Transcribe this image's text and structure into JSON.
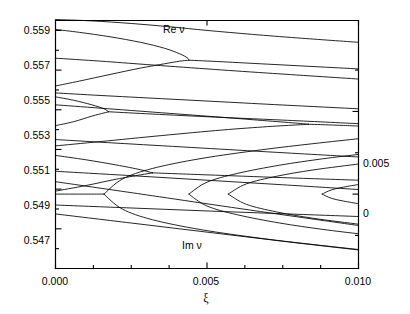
{
  "figure": {
    "background": "#ffffff",
    "line_color": "#000000",
    "axis_color": "#000000"
  },
  "axes": {
    "left": {
      "title": "",
      "ticks": [
        "0.559",
        "0.557",
        "0.555",
        "0.553",
        "0.551",
        "0.549",
        "0.547"
      ],
      "range": [
        0.547,
        0.5595
      ]
    },
    "right": {
      "title": "",
      "ticks": [
        "0.005",
        "0"
      ],
      "range": [
        -0.0045,
        0.0105
      ]
    },
    "bottom": {
      "title": "ξ",
      "ticks": [
        "0.000",
        "0.005",
        "0.010"
      ],
      "range": [
        0.0,
        0.01
      ]
    }
  },
  "annotations": [
    {
      "text": "Re ν",
      "x": 0.0038,
      "y": 0.5593
    },
    {
      "text": "Im ν",
      "x": 0.0044,
      "y": 0.5487
    }
  ],
  "chart_data": {
    "type": "line",
    "title": "",
    "xlabel": "ξ",
    "ylabel_left": "Re ν",
    "ylabel_right": "Im ν",
    "grid": false,
    "legend": "none",
    "xlim": [
      0.0,
      0.01
    ],
    "ylim_left": [
      0.547,
      0.5595
    ],
    "ylim_right": [
      -0.0045,
      0.0105
    ],
    "xticks": [
      0.0,
      0.005,
      0.01
    ],
    "xticklabels": [
      "0.000",
      "0.005",
      "0.010"
    ],
    "yticks_left": [
      0.547,
      0.549,
      0.551,
      0.553,
      0.555,
      0.557,
      0.559
    ],
    "yticklabels_left": [
      "0.547",
      "0.549",
      "0.551",
      "0.553",
      "0.555",
      "0.557",
      "0.559"
    ],
    "yticks_right": [
      0.0,
      0.005
    ],
    "yticklabels_right": [
      "0",
      "0.005"
    ],
    "series": [
      {
        "name": "Re nu branch 1 upper",
        "axis": "left",
        "points": [
          [
            0.0,
            0.55955
          ],
          [
            0.0012,
            0.55948
          ],
          [
            0.0025,
            0.55935
          ],
          [
            0.0038,
            0.55918
          ],
          [
            0.005,
            0.559
          ],
          [
            0.0065,
            0.5588
          ],
          [
            0.008,
            0.55862
          ],
          [
            0.01,
            0.5584
          ]
        ]
      },
      {
        "name": "Re nu pair A upper (turning at xi=0.0044)",
        "axis": "left",
        "points": [
          [
            0.0,
            0.55905
          ],
          [
            0.0008,
            0.5589
          ],
          [
            0.0018,
            0.55868
          ],
          [
            0.0028,
            0.5584
          ],
          [
            0.0036,
            0.5581
          ],
          [
            0.0041,
            0.55782
          ],
          [
            0.00435,
            0.55762
          ],
          [
            0.0044,
            0.5575
          ]
        ]
      },
      {
        "name": "Re nu pair A lower (turning at xi=0.0044)",
        "axis": "left",
        "points": [
          [
            0.0,
            0.5562
          ],
          [
            0.0008,
            0.55645
          ],
          [
            0.0018,
            0.55678
          ],
          [
            0.0028,
            0.5571
          ],
          [
            0.0036,
            0.55732
          ],
          [
            0.0041,
            0.55745
          ],
          [
            0.00435,
            0.55749
          ],
          [
            0.0044,
            0.5575
          ]
        ]
      },
      {
        "name": "Re nu pair A merged tail",
        "axis": "left",
        "points": [
          [
            0.0044,
            0.5575
          ],
          [
            0.0055,
            0.55742
          ],
          [
            0.007,
            0.5573
          ],
          [
            0.0085,
            0.55718
          ],
          [
            0.01,
            0.55706
          ]
        ]
      },
      {
        "name": "Re nu branch 2",
        "axis": "left",
        "points": [
          [
            0.0,
            0.5576
          ],
          [
            0.0015,
            0.55745
          ],
          [
            0.003,
            0.55728
          ],
          [
            0.005,
            0.55706
          ],
          [
            0.007,
            0.55685
          ],
          [
            0.01,
            0.55655
          ]
        ]
      },
      {
        "name": "Re nu branch 3",
        "axis": "left",
        "points": [
          [
            0.0,
            0.55585
          ],
          [
            0.0015,
            0.55572
          ],
          [
            0.0035,
            0.55556
          ],
          [
            0.0055,
            0.5554
          ],
          [
            0.0075,
            0.55524
          ],
          [
            0.01,
            0.55505
          ]
        ]
      },
      {
        "name": "Re nu pair B upper (turning at xi=0.00835)",
        "axis": "left",
        "points": [
          [
            0.0,
            0.55525
          ],
          [
            0.0015,
            0.55508
          ],
          [
            0.0035,
            0.55485
          ],
          [
            0.0055,
            0.55462
          ],
          [
            0.007,
            0.55444
          ],
          [
            0.008,
            0.55432
          ],
          [
            0.00835,
            0.55427
          ]
        ]
      },
      {
        "name": "Re nu pair B lower (turning at xi=0.00835)",
        "axis": "left",
        "points": [
          [
            0.0,
            0.55318
          ],
          [
            0.0015,
            0.5534
          ],
          [
            0.0035,
            0.5537
          ],
          [
            0.0055,
            0.55398
          ],
          [
            0.007,
            0.55415
          ],
          [
            0.008,
            0.55424
          ],
          [
            0.00835,
            0.55427
          ]
        ]
      },
      {
        "name": "Re nu pair B merged tail",
        "axis": "left",
        "points": [
          [
            0.00835,
            0.55427
          ],
          [
            0.009,
            0.55424
          ],
          [
            0.0095,
            0.55421
          ],
          [
            0.01,
            0.55418
          ]
        ]
      },
      {
        "name": "Re nu pair C upper (turning at xi=0.00175)",
        "axis": "left",
        "points": [
          [
            0.0,
            0.55565
          ],
          [
            0.0006,
            0.55548
          ],
          [
            0.0012,
            0.55525
          ],
          [
            0.0016,
            0.55505
          ],
          [
            0.00175,
            0.5549
          ]
        ]
      },
      {
        "name": "Re nu pair C lower (turning at xi=0.00175)",
        "axis": "left",
        "points": [
          [
            0.0,
            0.5542
          ],
          [
            0.0006,
            0.5544
          ],
          [
            0.0012,
            0.55468
          ],
          [
            0.0016,
            0.55484
          ],
          [
            0.00175,
            0.5549
          ]
        ]
      },
      {
        "name": "Re nu pair C merged tail",
        "axis": "left",
        "points": [
          [
            0.00175,
            0.5549
          ],
          [
            0.003,
            0.5548
          ],
          [
            0.005,
            0.55465
          ],
          [
            0.0075,
            0.55448
          ],
          [
            0.01,
            0.5543
          ]
        ]
      },
      {
        "name": "Re nu branch 4",
        "axis": "left",
        "points": [
          [
            0.0,
            0.5535
          ],
          [
            0.002,
            0.55332
          ],
          [
            0.0045,
            0.5531
          ],
          [
            0.007,
            0.55288
          ],
          [
            0.01,
            0.55262
          ]
        ]
      },
      {
        "name": "Re nu pair D upper (turning at xi=0.0032)",
        "axis": "left",
        "points": [
          [
            0.0,
            0.5527
          ],
          [
            0.001,
            0.55248
          ],
          [
            0.002,
            0.55222
          ],
          [
            0.0028,
            0.55198
          ],
          [
            0.0032,
            0.55182
          ]
        ]
      },
      {
        "name": "Re nu pair D lower (turning at xi=0.0032)",
        "axis": "left",
        "points": [
          [
            0.0,
            0.5509
          ],
          [
            0.001,
            0.55118
          ],
          [
            0.002,
            0.5515
          ],
          [
            0.0028,
            0.55172
          ],
          [
            0.0032,
            0.55182
          ]
        ]
      },
      {
        "name": "Re nu pair D merged tail",
        "axis": "left",
        "points": [
          [
            0.0032,
            0.55182
          ],
          [
            0.005,
            0.55172
          ],
          [
            0.0075,
            0.55158
          ],
          [
            0.01,
            0.55145
          ]
        ]
      },
      {
        "name": "Re nu branch 5",
        "axis": "left",
        "points": [
          [
            0.0,
            0.5519
          ],
          [
            0.0025,
            0.55168
          ],
          [
            0.005,
            0.55145
          ],
          [
            0.0075,
            0.55122
          ],
          [
            0.01,
            0.55098
          ]
        ]
      },
      {
        "name": "Re nu branch 6",
        "axis": "left",
        "points": [
          [
            0.0,
            0.5502
          ],
          [
            0.0025,
            0.55005
          ],
          [
            0.005,
            0.5499
          ],
          [
            0.0075,
            0.54976
          ],
          [
            0.01,
            0.54962
          ]
        ]
      },
      {
        "name": "Im nu zero axis segment",
        "axis": "right",
        "points": [
          [
            0.0,
            0.0
          ],
          [
            0.001,
            0.0
          ],
          [
            0.0016,
            0.0
          ]
        ]
      },
      {
        "name": "Im nu loop 1 upper (opens at xi=0.0016)",
        "axis": "right",
        "points": [
          [
            0.0016,
            0.0
          ],
          [
            0.0022,
            0.0009
          ],
          [
            0.0032,
            0.00155
          ],
          [
            0.0048,
            0.00215
          ],
          [
            0.0068,
            0.00268
          ],
          [
            0.0085,
            0.00305
          ],
          [
            0.01,
            0.00335
          ]
        ]
      },
      {
        "name": "Im nu loop 1 lower (opens at xi=0.0016)",
        "axis": "right",
        "points": [
          [
            0.0016,
            0.0
          ],
          [
            0.0022,
            -0.0009
          ],
          [
            0.0032,
            -0.00155
          ],
          [
            0.0048,
            -0.00215
          ],
          [
            0.0068,
            -0.00268
          ],
          [
            0.0085,
            -0.00305
          ],
          [
            0.01,
            -0.00335
          ]
        ]
      },
      {
        "name": "Im nu loop 2 upper (opens at xi=0.0044)",
        "axis": "right",
        "points": [
          [
            0.0044,
            0.0
          ],
          [
            0.005,
            0.00072
          ],
          [
            0.006,
            0.00125
          ],
          [
            0.0074,
            0.00175
          ],
          [
            0.0088,
            0.00213
          ],
          [
            0.01,
            0.0024
          ]
        ]
      },
      {
        "name": "Im nu loop 2 lower (opens at xi=0.0044)",
        "axis": "right",
        "points": [
          [
            0.0044,
            0.0
          ],
          [
            0.005,
            -0.00072
          ],
          [
            0.006,
            -0.00125
          ],
          [
            0.0074,
            -0.00175
          ],
          [
            0.0088,
            -0.00213
          ],
          [
            0.01,
            -0.0024
          ]
        ]
      },
      {
        "name": "Im nu loop 3 upper (opens at xi=0.0057)",
        "axis": "right",
        "points": [
          [
            0.0057,
            0.0
          ],
          [
            0.0063,
            0.00062
          ],
          [
            0.0073,
            0.00108
          ],
          [
            0.0085,
            0.00146
          ],
          [
            0.01,
            0.00182
          ]
        ]
      },
      {
        "name": "Im nu loop 3 lower (opens at xi=0.0057)",
        "axis": "right",
        "points": [
          [
            0.0057,
            0.0
          ],
          [
            0.0063,
            -0.00062
          ],
          [
            0.0073,
            -0.00108
          ],
          [
            0.0085,
            -0.00146
          ],
          [
            0.01,
            -0.00182
          ]
        ]
      },
      {
        "name": "Im nu loop 4 upper (opens at xi=0.0088)",
        "axis": "right",
        "points": [
          [
            0.0088,
            0.0
          ],
          [
            0.0091,
            0.00025
          ],
          [
            0.0095,
            0.00042
          ],
          [
            0.01,
            0.00058
          ]
        ]
      },
      {
        "name": "Im nu loop 4 lower (opens at xi=0.0088)",
        "axis": "right",
        "points": [
          [
            0.0088,
            0.0
          ],
          [
            0.0091,
            -0.00025
          ],
          [
            0.0095,
            -0.00042
          ],
          [
            0.01,
            -0.00058
          ]
        ]
      },
      {
        "name": "Im nu outer descending 1",
        "axis": "right",
        "points": [
          [
            0.0,
            0.00075
          ],
          [
            0.002,
            0.00022
          ],
          [
            0.0032,
            -0.0001
          ],
          [
            0.0055,
            -0.00072
          ],
          [
            0.008,
            -0.00138
          ],
          [
            0.01,
            -0.0019
          ]
        ]
      },
      {
        "name": "Im nu outer descending 2",
        "axis": "right",
        "points": [
          [
            0.0,
            -0.0012
          ],
          [
            0.0025,
            -0.00175
          ],
          [
            0.005,
            -0.0023
          ],
          [
            0.0075,
            -0.00285
          ],
          [
            0.01,
            -0.00338
          ]
        ]
      }
    ]
  }
}
